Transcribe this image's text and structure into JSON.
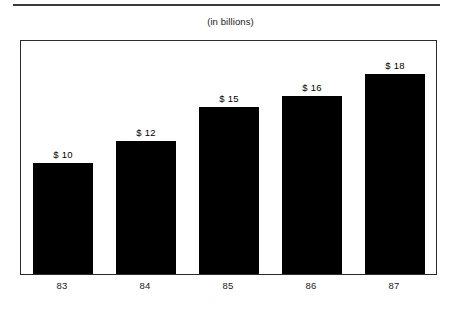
{
  "caption": "(in billions)",
  "colors": {
    "bar": "#000000",
    "frame": "#2b2b2b",
    "rule": "#3a3a3a",
    "background": "#ffffff",
    "text": "#1a1a1a"
  },
  "chart_data": {
    "type": "bar",
    "title": "",
    "subtitle": "(in billions)",
    "xlabel": "",
    "ylabel": "",
    "categories": [
      "83",
      "84",
      "85",
      "86",
      "87"
    ],
    "values": [
      10,
      12,
      15,
      16,
      18
    ],
    "data_labels": [
      "$ 10",
      "$ 12",
      "$ 15",
      "$ 16",
      "$ 18"
    ],
    "value_prefix": "$ ",
    "units": "billions",
    "ylim": [
      0,
      20.8
    ],
    "grid": false,
    "legend": false,
    "axis_ticks_visible": false,
    "bar_color": "#000000",
    "series": [
      {
        "name": "Amount",
        "values": [
          10,
          12,
          15,
          16,
          18
        ]
      }
    ]
  },
  "x_axis": {
    "ticks": [
      {
        "label": "83"
      },
      {
        "label": "84"
      },
      {
        "label": "85"
      },
      {
        "label": "86"
      },
      {
        "label": "87"
      }
    ]
  },
  "bars": [
    {
      "label": "$ 10",
      "value": 10,
      "category": "83"
    },
    {
      "label": "$ 12",
      "value": 12,
      "category": "84"
    },
    {
      "label": "$ 15",
      "value": 15,
      "category": "85"
    },
    {
      "label": "$ 16",
      "value": 16,
      "category": "86"
    },
    {
      "label": "$ 18",
      "value": 18,
      "category": "87"
    }
  ]
}
